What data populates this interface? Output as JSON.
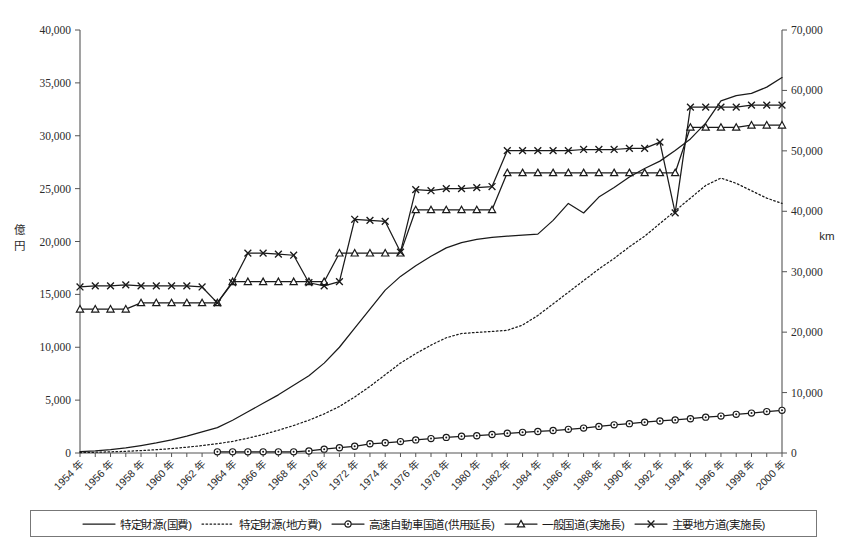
{
  "chart_data": {
    "type": "line",
    "title": "",
    "xlabel": "",
    "ylabel": "億円",
    "y2label": "km",
    "ylim": [
      0,
      40000
    ],
    "y2lim": [
      0,
      70000
    ],
    "ytick_labels": [
      "0",
      "5,000",
      "10,000",
      "15,000",
      "20,000",
      "25,000",
      "30,000",
      "35,000",
      "40,000"
    ],
    "ytick_values": [
      0,
      5000,
      10000,
      15000,
      20000,
      25000,
      30000,
      35000,
      40000
    ],
    "y2tick_labels": [
      "0",
      "10,000",
      "20,000",
      "30,000",
      "40,000",
      "50,000",
      "60,000",
      "70,000"
    ],
    "y2tick_values": [
      0,
      10000,
      20000,
      30000,
      40000,
      50000,
      60000,
      70000
    ],
    "grid": false,
    "legend_position": "bottom",
    "x": [
      1954,
      1955,
      1956,
      1957,
      1958,
      1959,
      1960,
      1961,
      1962,
      1963,
      1964,
      1965,
      1966,
      1967,
      1968,
      1969,
      1970,
      1971,
      1972,
      1973,
      1974,
      1975,
      1976,
      1977,
      1978,
      1979,
      1980,
      1981,
      1982,
      1983,
      1984,
      1985,
      1986,
      1987,
      1988,
      1989,
      1990,
      1991,
      1992,
      1993,
      1994,
      1995,
      1996,
      1997,
      1998,
      1999,
      2000
    ],
    "xtick_labels": [
      "1954 年",
      "1956 年",
      "1958 年",
      "1960 年",
      "1962 年",
      "1964 年",
      "1966 年",
      "1968 年",
      "1970 年",
      "1972 年",
      "1974 年",
      "1976 年",
      "1978 年",
      "1980 年",
      "1982 年",
      "1984 年",
      "1986 年",
      "1988 年",
      "1990 年",
      "1992 年",
      "1994 年",
      "1996 年",
      "1998 年",
      "2000 年"
    ],
    "xtick_values": [
      1954,
      1956,
      1958,
      1960,
      1962,
      1964,
      1966,
      1968,
      1970,
      1972,
      1974,
      1976,
      1978,
      1980,
      1982,
      1984,
      1986,
      1988,
      1990,
      1992,
      1994,
      1996,
      1998,
      2000
    ],
    "series": [
      {
        "name": "特定財源(国費)",
        "axis": "left",
        "unit": "億円",
        "style": "solid",
        "marker": "none",
        "values": [
          120,
          200,
          320,
          480,
          700,
          950,
          1250,
          1600,
          2000,
          2400,
          3100,
          3900,
          4700,
          5500,
          6400,
          7300,
          8500,
          10000,
          11800,
          13600,
          15400,
          16700,
          17700,
          18600,
          19400,
          19900,
          20200,
          20400,
          20500,
          20600,
          20700,
          22000,
          23600,
          22700,
          24200,
          25100,
          26100,
          26900,
          27600,
          28600,
          29700,
          31200,
          33300,
          33800,
          34000,
          34600,
          35500
        ]
      },
      {
        "name": "特定財源(地方費)",
        "axis": "left",
        "unit": "億円",
        "style": "dotted",
        "marker": "none",
        "values": [
          40,
          70,
          110,
          160,
          230,
          310,
          420,
          550,
          700,
          880,
          1100,
          1400,
          1750,
          2150,
          2600,
          3100,
          3700,
          4400,
          5300,
          6300,
          7400,
          8500,
          9400,
          10200,
          10900,
          11300,
          11400,
          11500,
          11600,
          12100,
          13000,
          14100,
          15200,
          16300,
          17400,
          18400,
          19500,
          20500,
          21700,
          22900,
          24100,
          25300,
          26000,
          25500,
          24800,
          24100,
          23600
        ]
      },
      {
        "name": "高速自動車国道(供用延長)",
        "axis": "right",
        "unit": "km",
        "style": "solid",
        "marker": "circle",
        "values": [
          null,
          null,
          null,
          null,
          null,
          null,
          null,
          null,
          null,
          190,
          190,
          190,
          190,
          190,
          190,
          340,
          640,
          880,
          1110,
          1520,
          1690,
          1890,
          2170,
          2380,
          2580,
          2770,
          2860,
          3060,
          3260,
          3420,
          3560,
          3720,
          3910,
          4120,
          4400,
          4660,
          4860,
          5100,
          5300,
          5480,
          5680,
          5930,
          6110,
          6400,
          6600,
          6850,
          7060
        ]
      },
      {
        "name": "一般国道(実施長)",
        "axis": "left",
        "unit": "km",
        "style": "solid",
        "marker": "triangle",
        "values": [
          13600,
          13600,
          13600,
          13600,
          14200,
          14200,
          14200,
          14200,
          14200,
          14200,
          16200,
          16200,
          16200,
          16200,
          16200,
          16200,
          16200,
          18900,
          18900,
          18900,
          18900,
          18900,
          23000,
          23000,
          23000,
          23000,
          23000,
          23000,
          26500,
          26500,
          26500,
          26500,
          26500,
          26500,
          26500,
          26500,
          26500,
          26500,
          26500,
          26500,
          30800,
          30800,
          30800,
          30800,
          31000,
          31000,
          31000
        ]
      },
      {
        "name": "主要地方道(実施長)",
        "axis": "left",
        "unit": "km",
        "style": "solid",
        "marker": "cross",
        "values": [
          15700,
          15800,
          15800,
          15900,
          15800,
          15800,
          15800,
          15800,
          15700,
          14200,
          16100,
          18900,
          18900,
          18800,
          18700,
          16100,
          15800,
          16200,
          22100,
          22000,
          21900,
          19000,
          24900,
          24800,
          25000,
          25000,
          25100,
          25200,
          28600,
          28600,
          28600,
          28600,
          28600,
          28700,
          28700,
          28700,
          28800,
          28800,
          29400,
          22700,
          32700,
          32700,
          32700,
          32700,
          32900,
          32900,
          32900
        ]
      }
    ]
  },
  "legend": {
    "items": [
      {
        "label": "特定財源(国費)",
        "style": "solid",
        "marker": "none"
      },
      {
        "label": "特定財源(地方費)",
        "style": "dotted",
        "marker": "none"
      },
      {
        "label": "高速自動車国道(供用延長)",
        "style": "solid",
        "marker": "circle"
      },
      {
        "label": "一般国道(実施長)",
        "style": "solid",
        "marker": "triangle"
      },
      {
        "label": "主要地方道(実施長)",
        "style": "solid",
        "marker": "cross"
      }
    ]
  },
  "axes": {
    "left_unit": "億円",
    "right_unit": "km"
  }
}
